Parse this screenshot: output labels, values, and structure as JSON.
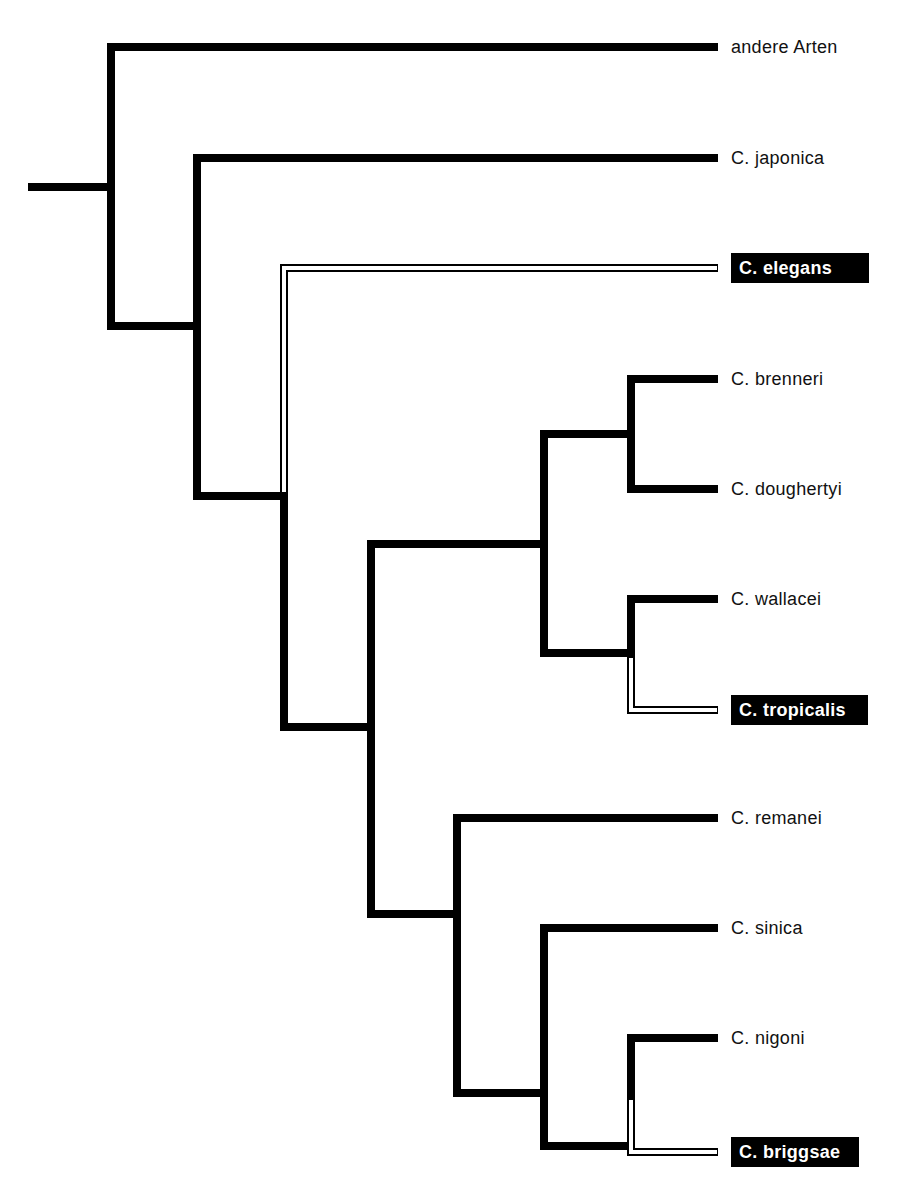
{
  "diagram": {
    "type": "phylogenetic-tree (cladogram)",
    "colors": {
      "branch": "#000000",
      "highlight_fill": "#ffffff",
      "highlight_label_bg": "#000000",
      "highlight_label_text": "#ffffff"
    },
    "leaves": [
      {
        "id": "andere",
        "label": "andere Arten",
        "highlighted": false
      },
      {
        "id": "japonica",
        "label": "C. japonica",
        "highlighted": false
      },
      {
        "id": "elegans",
        "label": "C. elegans",
        "highlighted": true
      },
      {
        "id": "brenneri",
        "label": "C. brenneri",
        "highlighted": false
      },
      {
        "id": "doughertyi",
        "label": "C. doughertyi",
        "highlighted": false
      },
      {
        "id": "wallacei",
        "label": "C. wallacei",
        "highlighted": false
      },
      {
        "id": "tropicalis",
        "label": "C. tropicalis",
        "highlighted": true
      },
      {
        "id": "remanei",
        "label": "C. remanei",
        "highlighted": false
      },
      {
        "id": "sinica",
        "label": "C. sinica",
        "highlighted": false
      },
      {
        "id": "nigoni",
        "label": "C. nigoni",
        "highlighted": false
      },
      {
        "id": "briggsae",
        "label": "C. briggsae",
        "highlighted": true
      }
    ],
    "topology": "(andere Arten,(C. japonica,(C. elegans,(((C. brenneri,C. doughertyi),(C. wallacei,C. tropicalis)),(C. remanei,(C. sinica,(C. nigoni,C. briggsae)))))))"
  }
}
